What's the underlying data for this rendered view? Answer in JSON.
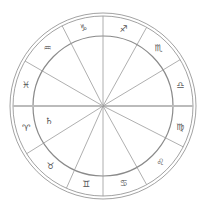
{
  "chart": {
    "center": [
      103,
      106
    ],
    "outer_radius_1": 93,
    "outer_radius_2": 90,
    "inner_radius": 70,
    "line_color": "#9a9a9a",
    "circle_color": "#8a8a8a",
    "horizon_color": "#bbbbbb",
    "cusp_angles_deg": [
      0,
      31,
      61,
      90,
      117,
      150,
      180,
      212,
      246,
      270,
      299,
      333
    ],
    "signs": [
      {
        "name": "capricorn",
        "glyph": "♑",
        "angle": 104
      },
      {
        "name": "sagittarius",
        "glyph": "♐",
        "angle": 75
      },
      {
        "name": "scorpio",
        "glyph": "♏",
        "angle": 46
      },
      {
        "name": "libra",
        "glyph": "♎",
        "angle": 15
      },
      {
        "name": "virgo",
        "glyph": "♍",
        "angle": 345
      },
      {
        "name": "leo",
        "glyph": "♌",
        "angle": 316
      },
      {
        "name": "cancer",
        "glyph": "♋",
        "angle": 285
      },
      {
        "name": "gemini",
        "glyph": "♊",
        "angle": 258
      },
      {
        "name": "taurus",
        "glyph": "♉",
        "angle": 229
      },
      {
        "name": "aries",
        "glyph": "♈",
        "angle": 196
      },
      {
        "name": "pisces",
        "glyph": "♓",
        "angle": 165
      },
      {
        "name": "aquarius",
        "glyph": "♒",
        "angle": 134
      }
    ],
    "planets": [
      {
        "name": "saturn",
        "glyph": "♄",
        "x": 49,
        "y": 121
      }
    ]
  }
}
